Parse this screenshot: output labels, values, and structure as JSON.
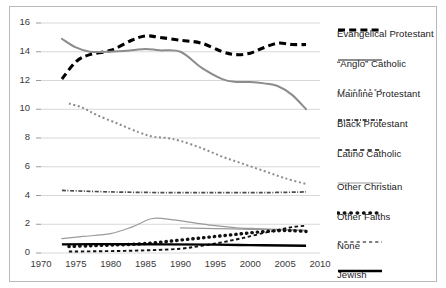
{
  "chart_data": {
    "type": "line",
    "title": "",
    "subtitle": "",
    "xlabel": "",
    "ylabel": "",
    "xlim": [
      1970,
      2010
    ],
    "ylim": [
      0,
      16
    ],
    "grid": true,
    "grid_axis": "y",
    "legend_position": "right",
    "x_ticks": [
      "1970",
      "1975",
      "1980",
      "1985",
      "1990",
      "1995",
      "2000",
      "2005",
      "2010"
    ],
    "y_ticks": [
      "0",
      "2",
      "4",
      "6",
      "8",
      "10",
      "12",
      "14",
      "16"
    ],
    "series": [
      {
        "name": "Evangelical Protestant",
        "style": "thick-dashed",
        "color": "#000000",
        "x": [
          1973,
          1975,
          1977,
          1980,
          1983,
          1985,
          1987,
          1990,
          1993,
          1996,
          1998,
          2000,
          2002,
          2004,
          2006,
          2008
        ],
        "values": [
          12.1,
          13.3,
          13.8,
          14.1,
          14.8,
          15.1,
          15.0,
          14.8,
          14.6,
          14.0,
          13.8,
          13.9,
          14.3,
          14.6,
          14.5,
          14.5
        ]
      },
      {
        "name": "“Anglo” Catholic",
        "style": "solid-gray",
        "color": "#8c8c8c",
        "x": [
          1973,
          1975,
          1977,
          1980,
          1983,
          1985,
          1987,
          1990,
          1993,
          1996,
          1998,
          2000,
          2002,
          2004,
          2006,
          2008
        ],
        "values": [
          14.9,
          14.3,
          14.0,
          14.0,
          14.1,
          14.2,
          14.1,
          14.0,
          12.9,
          12.1,
          11.9,
          11.9,
          11.8,
          11.6,
          11.0,
          10.0
        ]
      },
      {
        "name": "Mainline Protestant",
        "style": "fine-dotted",
        "color": "#8c8c8c",
        "x": [
          1974,
          1976,
          1978,
          1981,
          1984,
          1986,
          1988,
          1990,
          1993,
          1996,
          1999,
          2002,
          2005,
          2008
        ],
        "values": [
          10.4,
          10.1,
          9.6,
          9.0,
          8.4,
          8.1,
          8.0,
          7.8,
          7.3,
          6.7,
          6.2,
          5.7,
          5.2,
          4.8
        ]
      },
      {
        "name": "Black Protestant",
        "style": "dash-dot",
        "color": "#4a4a4a",
        "x": [
          1973,
          1980,
          1988,
          1995,
          2002,
          2008
        ],
        "values": [
          4.35,
          4.25,
          4.2,
          4.2,
          4.2,
          4.25
        ]
      },
      {
        "name": "Latino Catholic",
        "style": "thin-solid-gray",
        "color": "#9a9a9a",
        "x": [
          1973,
          1976,
          1980,
          1983,
          1986,
          1989,
          1992,
          1995,
          1998,
          2001,
          2004,
          2008
        ],
        "values": [
          1.0,
          1.15,
          1.35,
          1.8,
          2.4,
          2.3,
          2.1,
          1.9,
          1.75,
          1.7,
          1.65,
          1.6
        ]
      },
      {
        "name": "Other Christian",
        "style": "thin-line-gray",
        "color": "#9a9a9a",
        "x": [
          1990,
          1995,
          2000,
          2005,
          2008
        ],
        "values": [
          1.75,
          1.7,
          1.65,
          1.6,
          1.55
        ]
      },
      {
        "name": "Other Faiths",
        "style": "bold-dotted",
        "color": "#111111",
        "x": [
          1974,
          1977,
          1980,
          1983,
          1986,
          1989,
          1992,
          1995,
          1998,
          2001,
          2004,
          2006,
          2008
        ],
        "values": [
          0.45,
          0.5,
          0.55,
          0.6,
          0.7,
          0.85,
          1.0,
          1.15,
          1.3,
          1.45,
          1.55,
          1.55,
          1.5
        ]
      },
      {
        "name": "None",
        "style": "small-dashed",
        "color": "#111111",
        "x": [
          1974,
          1978,
          1982,
          1986,
          1990,
          1993,
          1996,
          1999,
          2002,
          2004,
          2006,
          2008
        ],
        "values": [
          0.1,
          0.12,
          0.15,
          0.2,
          0.3,
          0.5,
          0.75,
          1.05,
          1.4,
          1.6,
          1.8,
          1.9
        ]
      },
      {
        "name": "Jewish",
        "style": "thick-solid",
        "color": "#000000",
        "x": [
          1973,
          1980,
          1988,
          1995,
          2000,
          2005,
          2008
        ],
        "values": [
          0.6,
          0.62,
          0.6,
          0.58,
          0.55,
          0.52,
          0.5
        ]
      }
    ]
  },
  "legend": {
    "items": [
      {
        "label": "Evangelical Protestant",
        "marker": "thick-dashed-marker"
      },
      {
        "label": "“Anglo” Catholic",
        "marker": "solid-gray-marker"
      },
      {
        "label": "Mainline Protestant",
        "marker": "fine-dotted-marker"
      },
      {
        "label": "Black Protestant",
        "marker": "dash-dot-marker"
      },
      {
        "label": "Latino Catholic",
        "marker": "small-dashed-gray-marker"
      },
      {
        "label": "Other Christian",
        "marker": "thin-line-gray-marker"
      },
      {
        "label": "Other Faiths",
        "marker": "bold-dotted-marker"
      },
      {
        "label": "None",
        "marker": "fine-dashed-marker"
      },
      {
        "label": "Jewish",
        "marker": "thick-solid-marker"
      }
    ]
  },
  "colors": {
    "grid": "#d8d8d8",
    "frame": "#b9b9b9",
    "text": "#1a1a1a",
    "tick_text": "#3a3a3a",
    "black": "#000000",
    "gray": "#8c8c8c"
  }
}
